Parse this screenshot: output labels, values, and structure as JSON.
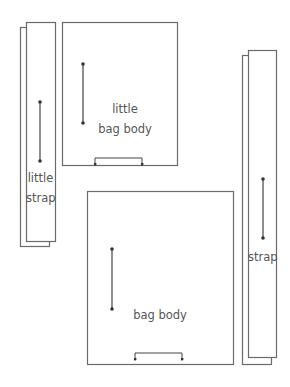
{
  "diagram": {
    "stroke_color": "#6a6a6a",
    "arrow_color": "#444444",
    "pieces": [
      {
        "id": "little-strap",
        "label_lines": [
          "little",
          "strap"
        ],
        "layers": 2,
        "front": {
          "x": 26,
          "y": 22,
          "w": 29,
          "h": 219
        },
        "back": {
          "x": 20,
          "y": 27,
          "w": 29,
          "h": 219
        },
        "grain_arrow": {
          "x": 40,
          "y1": 102,
          "y2": 161
        }
      },
      {
        "id": "little-bag-body",
        "label_lines": [
          "little",
          "bag body"
        ],
        "layers": 1,
        "rect": {
          "x": 62,
          "y": 22,
          "w": 115,
          "h": 143
        },
        "grain_arrow": {
          "x": 83,
          "y1": 64,
          "y2": 123
        },
        "fold_bracket": {
          "x1": 95,
          "x2": 142,
          "y": 158,
          "tip": 164
        }
      },
      {
        "id": "bag-body",
        "label_lines": [
          "bag body"
        ],
        "layers": 1,
        "rect": {
          "x": 87,
          "y": 191,
          "w": 146,
          "h": 173
        },
        "grain_arrow": {
          "x": 112,
          "y1": 249,
          "y2": 309
        },
        "fold_bracket": {
          "x1": 135,
          "x2": 182,
          "y": 353,
          "tip": 359
        }
      },
      {
        "id": "strap",
        "label_lines": [
          "strap"
        ],
        "layers": 2,
        "front": {
          "x": 248,
          "y": 50,
          "w": 28,
          "h": 307
        },
        "back": {
          "x": 242,
          "y": 55,
          "w": 29,
          "h": 309
        },
        "grain_arrow": {
          "x": 263,
          "y1": 179,
          "y2": 238
        }
      }
    ]
  },
  "labels": {
    "little_strap_1": "little",
    "little_strap_2": "strap",
    "little_bag_body_1": "little",
    "little_bag_body_2": "bag body",
    "bag_body": "bag body",
    "strap": "strap"
  }
}
